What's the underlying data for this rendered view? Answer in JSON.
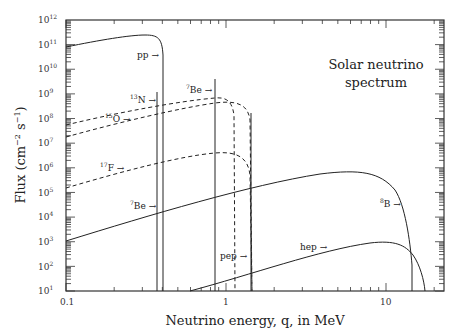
{
  "chart_data": {
    "type": "line",
    "xlabel": "Neutrino energy, q, in MeV",
    "ylabel": "Flux (cm^-2 s^-1)",
    "xscale": "log",
    "yscale": "log",
    "xlim": [
      0.1,
      23
    ],
    "ylim": [
      10,
      1000000000000.0
    ],
    "x_ticks": [
      {
        "value": 0.1,
        "label": "0.1"
      },
      {
        "value": 1,
        "label": "1"
      },
      {
        "value": 10,
        "label": "10"
      }
    ],
    "y_ticks": [
      {
        "exp": 1,
        "label": "10",
        "sup": "1"
      },
      {
        "exp": 2,
        "label": "10",
        "sup": "2"
      },
      {
        "exp": 3,
        "label": "10",
        "sup": "3"
      },
      {
        "exp": 4,
        "label": "10",
        "sup": "4"
      },
      {
        "exp": 5,
        "label": "10",
        "sup": "5"
      },
      {
        "exp": 6,
        "label": "10",
        "sup": "6"
      },
      {
        "exp": 7,
        "label": "10",
        "sup": "7"
      },
      {
        "exp": 8,
        "label": "10",
        "sup": "8"
      },
      {
        "exp": 9,
        "label": "10",
        "sup": "9"
      },
      {
        "exp": 10,
        "label": "10",
        "sup": "10"
      },
      {
        "exp": 11,
        "label": "10",
        "sup": "11"
      },
      {
        "exp": 12,
        "label": "10",
        "sup": "12"
      }
    ],
    "grid": false,
    "series": [
      {
        "name": "pp",
        "label": "pp",
        "style": "solid",
        "points": [
          [
            0.1,
            50000000000.0
          ],
          [
            0.15,
            75000000000.0
          ],
          [
            0.25,
            95000000000.0
          ],
          [
            0.33,
            80000000000.0
          ],
          [
            0.38,
            30000000000.0
          ],
          [
            0.41,
            1000000000.0
          ],
          [
            0.42,
            10
          ]
        ]
      },
      {
        "name": "7Be (0.38 MeV line)",
        "label": "7Be",
        "sup": "7",
        "base": "Be",
        "style": "solid-line",
        "energy": 0.384,
        "flux": 10000.0
      },
      {
        "name": "7Be (0.86 MeV line)",
        "label": "7Be",
        "sup": "7",
        "base": "Be",
        "style": "solid-line",
        "energy": 0.862,
        "flux": 70000000000.0
      },
      {
        "name": "pep",
        "label": "pep",
        "style": "solid-line",
        "energy": 1.44,
        "flux": 120000000.0
      },
      {
        "name": "13N",
        "label": "13N",
        "sup": "13",
        "base": "N",
        "style": "dashed",
        "points": [
          [
            0.1,
            110000000.0
          ],
          [
            0.3,
            300000000.0
          ],
          [
            0.86,
            600000000.0
          ],
          [
            1.05,
            500000000.0
          ],
          [
            1.15,
            100000000.0
          ],
          [
            1.2,
            10
          ]
        ]
      },
      {
        "name": "15O",
        "label": "15O",
        "sup": "15",
        "base": "O",
        "style": "dashed",
        "points": [
          [
            0.1,
            35000000.0
          ],
          [
            0.3,
            130000000.0
          ],
          [
            0.86,
            450000000.0
          ],
          [
            1.4,
            400000000.0
          ],
          [
            1.65,
            100000000.0
          ],
          [
            1.73,
            10
          ]
        ]
      },
      {
        "name": "17F",
        "label": "17F",
        "sup": "17",
        "base": "F",
        "style": "dashed",
        "points": [
          [
            0.1,
            250000.0
          ],
          [
            0.3,
            1100000.0
          ],
          [
            0.86,
            3500000.0
          ],
          [
            1.3,
            3500000.0
          ],
          [
            1.65,
            800000.0
          ],
          [
            1.74,
            10
          ]
        ]
      },
      {
        "name": "8B",
        "label": "8B",
        "sup": "8",
        "base": "B",
        "style": "solid",
        "points": [
          [
            0.1,
            1000.0
          ],
          [
            0.3,
            5000.0
          ],
          [
            1,
            25000.0
          ],
          [
            3,
            60000.0
          ],
          [
            6.5,
            90000.0
          ],
          [
            10,
            70000.0
          ],
          [
            13,
            20000.0
          ],
          [
            14.5,
            200.0
          ],
          [
            15,
            10
          ]
        ]
      },
      {
        "name": "hep",
        "label": "hep",
        "style": "solid",
        "points": [
          [
            0.55,
            10
          ],
          [
            1,
            30.0
          ],
          [
            3,
            250.0
          ],
          [
            8,
            800.0
          ],
          [
            12,
            700.0
          ],
          [
            15,
            200.0
          ],
          [
            18,
            10
          ]
        ]
      }
    ],
    "annotations": [
      {
        "text": "pp",
        "arrow": "→"
      },
      {
        "text": "13N",
        "arrow": "→"
      },
      {
        "text": "15O",
        "arrow": "→"
      },
      {
        "text": "17F",
        "arrow": "→"
      },
      {
        "text": "7Be",
        "arrow": "→"
      },
      {
        "text": "8B",
        "arrow": "→"
      },
      {
        "text": "pep",
        "arrow": "→"
      },
      {
        "text": "hep",
        "arrow": "→"
      }
    ]
  },
  "labels": {
    "title_line1": "Solar neutrino",
    "title_line2": "spectrum",
    "xlabel": "Neutrino energy, q, in MeV",
    "ylabel_main": "Flux (cm",
    "ylabel_exp1": "−2",
    "ylabel_mid": " s",
    "ylabel_exp2": "−1",
    "ylabel_end": ")",
    "x0": "0.1",
    "x1": "1",
    "x2": "10",
    "ytick_base": "10",
    "ann_pp": "pp →",
    "ann_13N_sup": "13",
    "ann_13N_base": "N →",
    "ann_15O_sup": "15",
    "ann_15O_base": "O →",
    "ann_17F_sup": "17",
    "ann_17F_base": "F →",
    "ann_7Be_top_sup": "7",
    "ann_7Be_top_base": "Be →",
    "ann_7Be_low_sup": "7",
    "ann_7Be_low_base": "Be →",
    "ann_8B_sup": "8",
    "ann_8B_base": "B →",
    "ann_pep": "pep →",
    "ann_hep": "hep →"
  },
  "colors": {
    "ink": "#222222",
    "frame": "#333333",
    "background": "#ffffff"
  }
}
